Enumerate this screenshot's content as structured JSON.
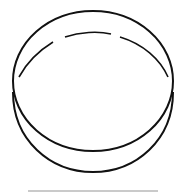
{
  "icon": {
    "semantic": "petri-dish-icon",
    "stroke_color": "#111111",
    "baseline_color": "#b8b8b8"
  }
}
